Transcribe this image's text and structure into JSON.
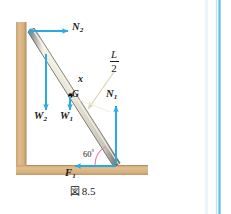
{
  "figure": {
    "caption_symbol": "図",
    "caption_number": "8.5",
    "caption_full": "図 8.5",
    "colors": {
      "force_arrow": "#29ABE2",
      "wall_floor": "#D9B384",
      "wall_floor_edge": "#B8925F",
      "rod_fill": "#EDEAE0",
      "rod_edge": "#5A5A5A",
      "angle_arc": "#E87DB0",
      "leader_line": "#D8D4B0",
      "page_rule": "#5BBCE4",
      "background": "#FFFFFF"
    },
    "wall": {
      "label": "vertical-wall",
      "x": 16,
      "y": 22,
      "width": 10,
      "height": 145
    },
    "floor": {
      "label": "horizontal-floor",
      "x": 16,
      "y": 165,
      "width": 132,
      "height": 10
    },
    "rod": {
      "label": "uniform-rod",
      "top_x": 31,
      "top_y": 30,
      "bottom_x": 116,
      "bottom_y": 164,
      "thickness": 6
    },
    "center_of_gravity": {
      "label": "G",
      "x": 71,
      "y": 96
    },
    "forces": [
      {
        "id": "N2",
        "label": "N",
        "subscript": "2",
        "direction": "right",
        "description": "Normal force from wall at top of rod",
        "tail_x": 31,
        "tail_y": 31,
        "head_x": 68,
        "head_y": 31,
        "label_x": 73,
        "label_y": 26
      },
      {
        "id": "W2",
        "label": "W",
        "subscript": "2",
        "direction": "down",
        "description": "Weight of additional load acting downward",
        "tail_x": 46,
        "tail_y": 54,
        "head_x": 46,
        "head_y": 110,
        "label_x": 36,
        "label_y": 115
      },
      {
        "id": "W1",
        "label": "W",
        "subscript": "1",
        "direction": "down",
        "description": "Weight of the rod acting at G",
        "tail_x": 70,
        "tail_y": 96,
        "head_x": 70,
        "head_y": 110,
        "label_x": 62,
        "label_y": 115
      },
      {
        "id": "N1",
        "label": "N",
        "subscript": "1",
        "direction": "up",
        "description": "Normal force from floor at bottom of rod",
        "tail_x": 116,
        "tail_y": 164,
        "head_x": 116,
        "head_y": 107,
        "label_x": 107,
        "label_y": 94
      },
      {
        "id": "F1",
        "label": "F",
        "subscript": "1",
        "direction": "left",
        "description": "Friction force from floor at bottom of rod",
        "tail_x": 116,
        "tail_y": 166,
        "head_x": 74,
        "head_y": 166,
        "label_x": 67,
        "label_y": 172
      }
    ],
    "dimension_labels": [
      {
        "id": "x",
        "text": "x",
        "description": "Distance x measured along the rod",
        "x": 79,
        "y": 80
      },
      {
        "id": "L_over_2",
        "numerator": "L",
        "fraction_bar": true,
        "denominator": "2",
        "description": "Half length of the rod, leader line points to rod midpoint",
        "x": 112,
        "y": 56,
        "leader_from_x": 112,
        "leader_from_y": 72,
        "leader_to_x": 86,
        "leader_to_y": 111
      }
    ],
    "angle": {
      "id": "angle-60",
      "value": "60",
      "degree_symbol": "°",
      "text": "60°",
      "description": "Angle between rod and floor",
      "vertex_x": 116,
      "vertex_y": 165,
      "label_x": 84,
      "label_y": 152
    }
  }
}
